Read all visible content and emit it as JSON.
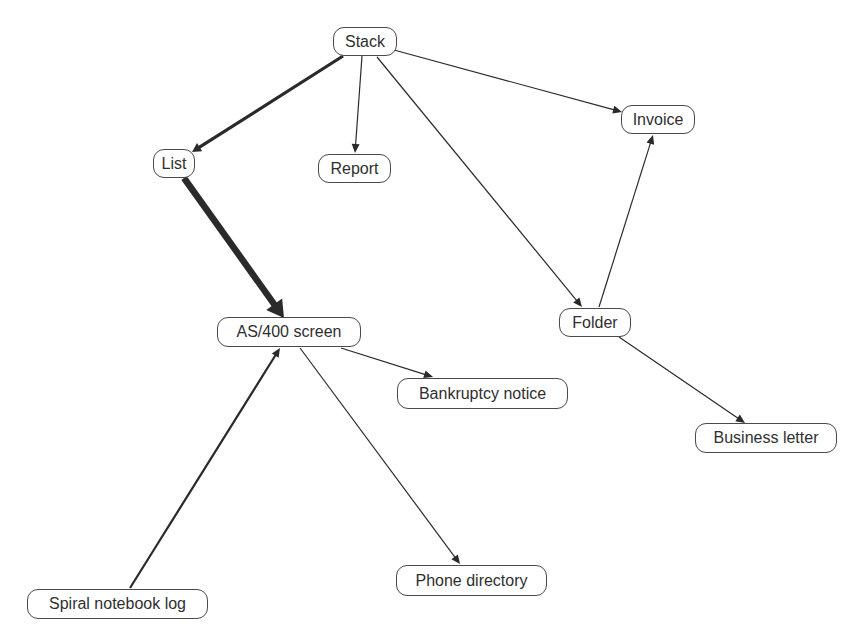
{
  "diagram": {
    "type": "directed-graph",
    "background": "#ffffff",
    "edge_color": "#2a2a2a",
    "node_border_color": "#4a4a4a",
    "node_text_color": "#2f2f2f",
    "nodes": [
      {
        "id": "stack",
        "label": "Stack",
        "x": 333,
        "y": 27,
        "w": 64,
        "h": 29
      },
      {
        "id": "list",
        "label": "List",
        "x": 153,
        "y": 149,
        "w": 42,
        "h": 29
      },
      {
        "id": "report",
        "label": "Report",
        "x": 318,
        "y": 154,
        "w": 73,
        "h": 29
      },
      {
        "id": "invoice",
        "label": "Invoice",
        "x": 621,
        "y": 105,
        "w": 74,
        "h": 29
      },
      {
        "id": "as400",
        "label": "AS/400 screen",
        "x": 217,
        "y": 317,
        "w": 144,
        "h": 30
      },
      {
        "id": "folder",
        "label": "Folder",
        "x": 559,
        "y": 308,
        "w": 72,
        "h": 29
      },
      {
        "id": "bankruptcy",
        "label": "Bankruptcy notice",
        "x": 397,
        "y": 378,
        "w": 171,
        "h": 31
      },
      {
        "id": "business",
        "label": "Business letter",
        "x": 695,
        "y": 423,
        "w": 142,
        "h": 30
      },
      {
        "id": "phone",
        "label": "Phone directory",
        "x": 396,
        "y": 565,
        "w": 151,
        "h": 31
      },
      {
        "id": "spiral",
        "label": "Spiral notebook log",
        "x": 27,
        "y": 589,
        "w": 181,
        "h": 30
      }
    ],
    "edges": [
      {
        "from": "stack",
        "to": "list",
        "x1": 343,
        "y1": 56,
        "x2": 192,
        "y2": 152,
        "width": 3.2
      },
      {
        "from": "stack",
        "to": "report",
        "x1": 362,
        "y1": 56,
        "x2": 355,
        "y2": 153,
        "width": 1.2
      },
      {
        "from": "stack",
        "to": "invoice",
        "x1": 394,
        "y1": 50,
        "x2": 622,
        "y2": 112,
        "width": 1.2
      },
      {
        "from": "stack",
        "to": "folder",
        "x1": 377,
        "y1": 57,
        "x2": 582,
        "y2": 307,
        "width": 1.2
      },
      {
        "from": "list",
        "to": "as400",
        "x1": 184,
        "y1": 178,
        "x2": 284,
        "y2": 318,
        "width": 6.5
      },
      {
        "from": "folder",
        "to": "invoice",
        "x1": 599,
        "y1": 307,
        "x2": 653,
        "y2": 135,
        "width": 1.2
      },
      {
        "from": "folder",
        "to": "business",
        "x1": 619,
        "y1": 337,
        "x2": 745,
        "y2": 423,
        "width": 1.2
      },
      {
        "from": "as400",
        "to": "bankruptcy",
        "x1": 341,
        "y1": 348,
        "x2": 433,
        "y2": 377,
        "width": 1.2
      },
      {
        "from": "as400",
        "to": "phone",
        "x1": 300,
        "y1": 348,
        "x2": 460,
        "y2": 564,
        "width": 1.2
      },
      {
        "from": "spiral",
        "to": "as400",
        "x1": 130,
        "y1": 588,
        "x2": 280,
        "y2": 348,
        "width": 2.2
      }
    ]
  }
}
